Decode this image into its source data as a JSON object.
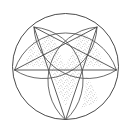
{
  "figure": {
    "title": "Circle with inscribed five-pointed star and arcs",
    "background_color": "#ffffff",
    "line_color": "#4a4a4a",
    "arc_color": "#5a5a5a",
    "stipple_color": "#707070",
    "canvas": {
      "width": 131,
      "height": 131
    },
    "circle": {
      "center_x": 65.5,
      "center_y": 66.5,
      "radius": 53.5,
      "stroke_width": 1.0
    },
    "star": {
      "points": 5,
      "vertex_count": 5,
      "circumradius": 53.5,
      "rotation_deg": 180,
      "vertices": [
        {
          "name": "vertex-bottom",
          "x": 65.5,
          "y": 120.0
        },
        {
          "name": "vertex-right",
          "x": 116.4,
          "y": 70.0
        },
        {
          "name": "vertex-top-right",
          "x": 97.0,
          "y": 27.1
        },
        {
          "name": "vertex-top-left",
          "x": 34.0,
          "y": 27.1
        },
        {
          "name": "vertex-left",
          "x": 14.6,
          "y": 70.0
        }
      ],
      "chords": [
        {
          "from": "vertex-bottom",
          "to": "vertex-top-right"
        },
        {
          "from": "vertex-top-right",
          "to": "vertex-left"
        },
        {
          "from": "vertex-left",
          "to": "vertex-right"
        },
        {
          "from": "vertex-right",
          "to": "vertex-top-left"
        },
        {
          "from": "vertex-top-left",
          "to": "vertex-bottom"
        }
      ]
    },
    "arcs": {
      "count": 5,
      "radius": 53.5,
      "note": "Five arcs of the same radius as the main circle, each centred on one star vertex, sweeping across the interior to form petal shapes."
    },
    "stipple_regions": {
      "count": 5,
      "pattern": "random fine dots",
      "dot_radius": 0.35,
      "density": "medium"
    },
    "stroke_widths": {
      "outer_circle": 1.0,
      "star_lines": 0.9,
      "arcs": 0.9
    }
  }
}
